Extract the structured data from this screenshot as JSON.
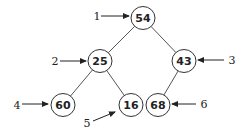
{
  "diagram": {
    "type": "binary-tree",
    "nodes": [
      {
        "id": "n1",
        "value": "54",
        "x": 143,
        "y": 18
      },
      {
        "id": "n2",
        "value": "25",
        "x": 100,
        "y": 61
      },
      {
        "id": "n3",
        "value": "43",
        "x": 184,
        "y": 61
      },
      {
        "id": "n4",
        "value": "60",
        "x": 63,
        "y": 105
      },
      {
        "id": "n5",
        "value": "16",
        "x": 131,
        "y": 105
      },
      {
        "id": "n6",
        "value": "68",
        "x": 158,
        "y": 105
      }
    ],
    "edges": [
      {
        "from": "n1",
        "to": "n2"
      },
      {
        "from": "n1",
        "to": "n3"
      },
      {
        "from": "n2",
        "to": "n4"
      },
      {
        "from": "n2",
        "to": "n5"
      },
      {
        "from": "n3",
        "to": "n6"
      }
    ],
    "labels": [
      {
        "text": "1",
        "x": 97,
        "y": 16,
        "arrow": [
          101,
          16,
          129,
          16
        ]
      },
      {
        "text": "2",
        "x": 55,
        "y": 61,
        "arrow": [
          60,
          61,
          86,
          61
        ]
      },
      {
        "text": "3",
        "x": 232,
        "y": 60,
        "arrow": [
          224,
          60,
          198,
          60
        ]
      },
      {
        "text": "4",
        "x": 17,
        "y": 105,
        "arrow": [
          22,
          104,
          48,
          104
        ]
      },
      {
        "text": "5",
        "x": 87,
        "y": 123,
        "arrow": [
          93,
          121,
          115,
          112
        ]
      },
      {
        "text": "6",
        "x": 204,
        "y": 104,
        "arrow": [
          196,
          104,
          172,
          104
        ]
      }
    ]
  }
}
